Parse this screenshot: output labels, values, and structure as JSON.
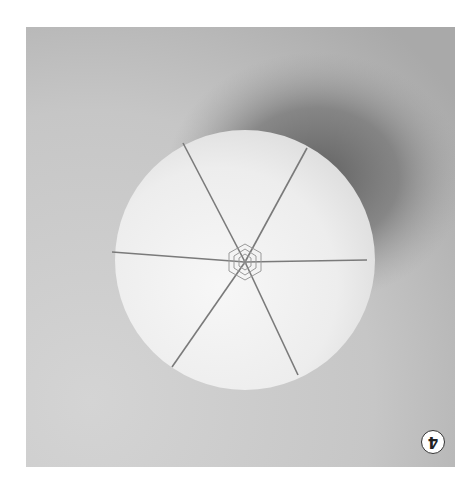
{
  "figure": {
    "step_badge": "4",
    "badge_rotated": true,
    "colors": {
      "background": "#c9c9c9",
      "shadow": "#6e6e6e",
      "ball": "#f2f2f2",
      "thread": "#7a7a7a",
      "badge_border": "#333333"
    },
    "ball": {
      "cx": 219,
      "cy": 235,
      "r": 130,
      "divisions": 6
    }
  }
}
